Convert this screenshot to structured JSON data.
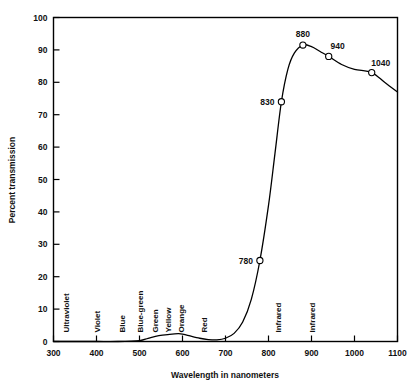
{
  "chart_data": {
    "type": "line",
    "title": "",
    "xlabel": "Wavelength in nanometers",
    "ylabel": "Percent transmission",
    "xlim": [
      300,
      1100
    ],
    "ylim": [
      0,
      100
    ],
    "xticks": [
      300,
      400,
      500,
      600,
      700,
      800,
      900,
      1000,
      1100
    ],
    "yticks": [
      0,
      10,
      20,
      30,
      40,
      50,
      60,
      70,
      80,
      90,
      100
    ],
    "grid": false,
    "legend": "none",
    "series": [
      {
        "name": "transmission",
        "x": [
          300,
          350,
          400,
          450,
          500,
          520,
          545,
          570,
          590,
          600,
          615,
          640,
          660,
          680,
          700,
          720,
          740,
          760,
          780,
          800,
          815,
          830,
          845,
          860,
          880,
          900,
          920,
          940,
          970,
          1000,
          1040,
          1070,
          1100
        ],
        "y": [
          0,
          0,
          0,
          0,
          0.3,
          1.0,
          1.8,
          2.2,
          2.4,
          2.3,
          1.8,
          1.0,
          0.6,
          0.5,
          1.0,
          2.5,
          6,
          13,
          25,
          42,
          58,
          74,
          84,
          89,
          91.5,
          91,
          89.5,
          88,
          85.5,
          84,
          83,
          80,
          77
        ]
      }
    ],
    "markers": [
      {
        "label": "780",
        "x": 780,
        "y": 25,
        "label_pos": "left"
      },
      {
        "label": "830",
        "x": 830,
        "y": 74,
        "label_pos": "left"
      },
      {
        "label": "880",
        "x": 880,
        "y": 91.5,
        "label_pos": "above"
      },
      {
        "label": "940",
        "x": 940,
        "y": 88,
        "label_pos": "above-right"
      },
      {
        "label": "1040",
        "x": 1040,
        "y": 83,
        "label_pos": "above-right"
      }
    ],
    "band_labels": [
      {
        "text": "Ultraviolet",
        "x": 337
      },
      {
        "text": "Violet",
        "x": 408
      },
      {
        "text": "Blue",
        "x": 466
      },
      {
        "text": "Blue-green",
        "x": 508
      },
      {
        "text": "Green",
        "x": 543
      },
      {
        "text": "Yellow",
        "x": 574
      },
      {
        "text": "Orange",
        "x": 603
      },
      {
        "text": "Red",
        "x": 657
      },
      {
        "text": "Infrared",
        "x": 828
      },
      {
        "text": "Infrared",
        "x": 908
      }
    ],
    "colors": {
      "line": "#000000",
      "axis": "#000000",
      "background": "#ffffff",
      "marker_fill": "#ffffff"
    }
  }
}
